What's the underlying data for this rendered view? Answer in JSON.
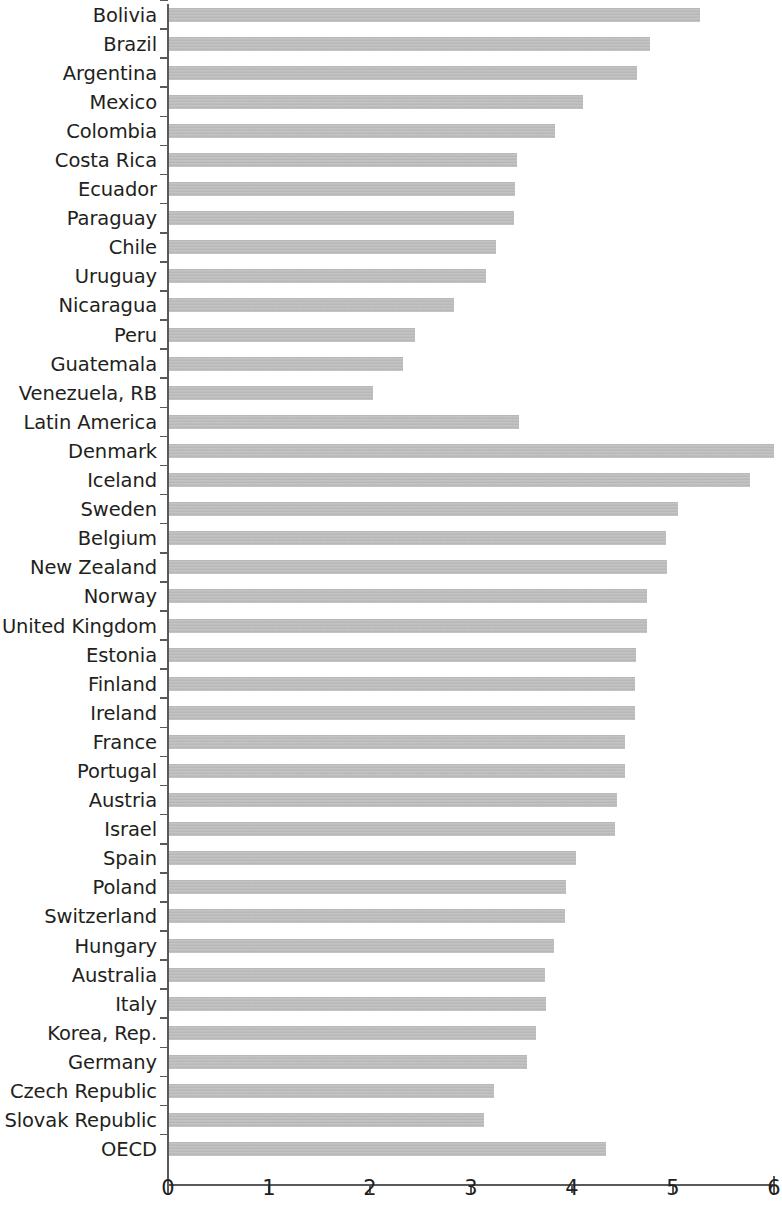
{
  "chart_data": {
    "type": "bar",
    "orientation": "horizontal",
    "title": "",
    "subtitle": "",
    "xlabel": "",
    "ylabel": "",
    "xlim": [
      0,
      6
    ],
    "xticks": [
      "0",
      "1",
      "2",
      "3",
      "4",
      "5",
      "6"
    ],
    "grid": false,
    "legend": null,
    "bar_color": "#bcbcbc",
    "axis_color": "#58595b",
    "text_color": "#231f20",
    "categories": [
      "Bolivia",
      "Brazil",
      "Argentina",
      "Mexico",
      "Colombia",
      "Costa Rica",
      "Ecuador",
      "Paraguay",
      "Chile",
      "Uruguay",
      "Nicaragua",
      "Peru",
      "Guatemala",
      "Venezuela, RB",
      "Latin America",
      "Denmark",
      "Iceland",
      "Sweden",
      "Belgium",
      "New Zealand",
      "Norway",
      "United Kingdom",
      "Estonia",
      "Finland",
      "Ireland",
      "France",
      "Portugal",
      "Austria",
      "Israel",
      "Spain",
      "Poland",
      "Switzerland",
      "Hungary",
      "Australia",
      "Italy",
      "Korea, Rep.",
      "Germany",
      "Czech Republic",
      "Slovak Republic",
      "OECD"
    ],
    "values": [
      5.27,
      4.77,
      4.64,
      4.11,
      3.83,
      3.46,
      3.44,
      3.43,
      3.25,
      3.15,
      2.83,
      2.45,
      2.33,
      2.03,
      3.48,
      6.0,
      5.76,
      5.05,
      4.93,
      4.94,
      4.74,
      4.74,
      4.63,
      4.62,
      4.62,
      4.52,
      4.52,
      4.45,
      4.43,
      4.04,
      3.94,
      3.93,
      3.82,
      3.73,
      3.74,
      3.64,
      3.55,
      3.23,
      3.13,
      4.34
    ]
  },
  "axis": {
    "tick_labels": [
      "0",
      "1",
      "2",
      "3",
      "4",
      "5",
      "6"
    ]
  }
}
